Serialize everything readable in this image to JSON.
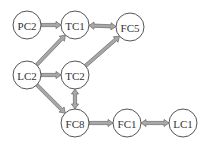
{
  "diagram": {
    "title": "",
    "node_radius": 14,
    "colors": {
      "node_fill": "#ffffff",
      "node_stroke": "#555555",
      "edge_fill": "#a8a8a8",
      "edge_stroke": "#666666",
      "label": "#333333"
    },
    "nodes": [
      {
        "id": "PC2",
        "label": "PC2",
        "x": 27,
        "y": 25
      },
      {
        "id": "TC1",
        "label": "TC1",
        "x": 75,
        "y": 25
      },
      {
        "id": "FC5",
        "label": "FC5",
        "x": 130,
        "y": 27
      },
      {
        "id": "LC2",
        "label": "LC2",
        "x": 27,
        "y": 75
      },
      {
        "id": "TC2",
        "label": "TC2",
        "x": 75,
        "y": 75
      },
      {
        "id": "FC8",
        "label": "FC8",
        "x": 75,
        "y": 123
      },
      {
        "id": "FC1",
        "label": "FC1",
        "x": 127,
        "y": 123
      },
      {
        "id": "LC1",
        "label": "LC1",
        "x": 183,
        "y": 123
      }
    ],
    "edges": [
      {
        "from": "PC2",
        "to": "TC1",
        "bidirectional": false
      },
      {
        "from": "TC1",
        "to": "FC5",
        "bidirectional": true
      },
      {
        "from": "LC2",
        "to": "TC1",
        "bidirectional": false
      },
      {
        "from": "LC2",
        "to": "TC2",
        "bidirectional": false
      },
      {
        "from": "LC2",
        "to": "FC8",
        "bidirectional": false
      },
      {
        "from": "TC2",
        "to": "FC5",
        "bidirectional": false
      },
      {
        "from": "TC2",
        "to": "FC8",
        "bidirectional": true
      },
      {
        "from": "FC8",
        "to": "FC1",
        "bidirectional": false
      },
      {
        "from": "FC1",
        "to": "LC1",
        "bidirectional": true
      }
    ]
  }
}
